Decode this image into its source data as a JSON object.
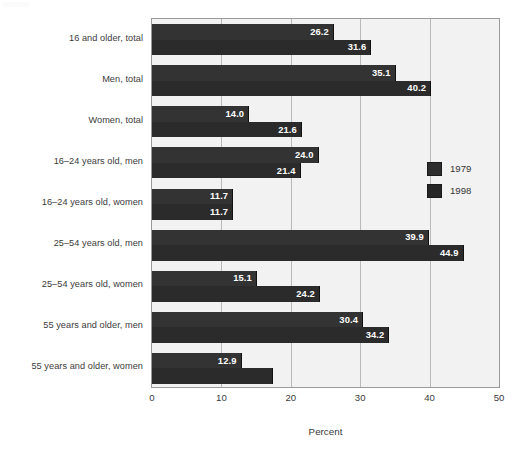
{
  "chart_data": {
    "type": "bar",
    "orientation": "horizontal",
    "title": "",
    "xlabel": "Percent",
    "ylabel": "",
    "xlim": [
      0,
      50
    ],
    "xticks": [
      0,
      10,
      20,
      30,
      40,
      50
    ],
    "xtick_labels": [
      "0",
      "10",
      "20",
      "30",
      "40",
      "50"
    ],
    "grid": true,
    "grid_axis": "x",
    "legend_position": "center-right-inside",
    "categories": [
      "16 and older, total",
      "Men, total",
      "Women, total",
      "16–24 years old, men",
      "16–24 years old, women",
      "25–54 years old, men",
      "25–54 years old, women",
      "55 years and older, men",
      "55 years and older, women"
    ],
    "series": [
      {
        "name": "1979",
        "color": "#333333",
        "values": [
          26.2,
          35.1,
          14.0,
          24.0,
          11.7,
          39.9,
          15.1,
          30.4,
          12.9
        ],
        "labels": [
          "26.2",
          "35.1",
          "14.0",
          "24.0",
          "11.7",
          "39.9",
          "15.1",
          "30.4",
          "12.9"
        ]
      },
      {
        "name": "1998",
        "color": "#2b2b2b",
        "values": [
          31.6,
          40.2,
          21.6,
          21.4,
          11.7,
          44.9,
          24.2,
          34.2,
          17.5
        ],
        "labels": [
          "31.6",
          "40.2",
          "21.6",
          "21.4",
          "11.7",
          "44.9",
          "24.2",
          "34.2",
          ""
        ]
      }
    ]
  },
  "legend": {
    "entries": [
      {
        "label": "1979"
      },
      {
        "label": "1998"
      }
    ]
  },
  "axis": {
    "x_title": "Percent",
    "ticks": [
      "0",
      "10",
      "20",
      "30",
      "40",
      "50"
    ]
  },
  "colors": {
    "bar_1979": "#333333",
    "bar_1998": "#2b2b2b",
    "plot_background": "#f2f2f2",
    "gridline": "#b9b9b9",
    "frame": "#9a9a9a",
    "text": "#3b3b3b",
    "value_label": "#ffffff"
  }
}
